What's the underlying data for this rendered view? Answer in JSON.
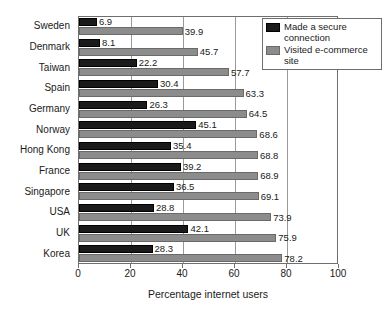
{
  "chart_data": {
    "type": "bar",
    "orientation": "horizontal",
    "title": "",
    "xlabel": "Percentage internet users",
    "ylabel": "",
    "xlim": [
      0,
      100
    ],
    "xticks": [
      0,
      20,
      40,
      60,
      80,
      100
    ],
    "grid": true,
    "legend_position": "top-right",
    "categories": [
      "Sweden",
      "Denmark",
      "Taiwan",
      "Spain",
      "Germany",
      "Norway",
      "Hong Kong",
      "France",
      "Singapore",
      "USA",
      "UK",
      "Korea"
    ],
    "series": [
      {
        "name": "Made a secure connection",
        "color": "#1a1a1a",
        "values": [
          6.9,
          8.1,
          22.2,
          30.4,
          26.3,
          45.1,
          35.4,
          39.2,
          36.5,
          28.8,
          42.1,
          28.3
        ]
      },
      {
        "name": "Visited e-commerce site",
        "color": "#8c8c8c",
        "values": [
          39.9,
          45.7,
          57.7,
          63.3,
          64.5,
          68.6,
          68.8,
          68.9,
          69.1,
          73.9,
          75.9,
          78.2
        ]
      }
    ]
  },
  "legend": {
    "items": [
      {
        "label": "Made a secure connection",
        "swatch": "secure"
      },
      {
        "label": "Visited e-commerce site",
        "swatch": "visited"
      }
    ]
  }
}
